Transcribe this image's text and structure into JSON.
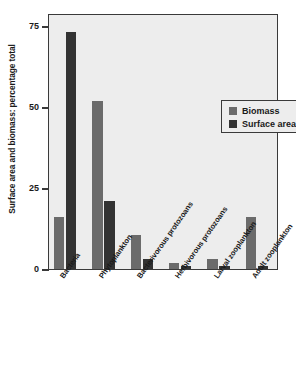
{
  "chart_data": {
    "type": "bar",
    "title": "",
    "xlabel": "",
    "ylabel": "Surface area and biomass: percentage total",
    "ylim": [
      0,
      79
    ],
    "yticks": [
      0,
      25,
      50,
      75
    ],
    "ytick_labels": [
      "0",
      "25",
      "50",
      "75"
    ],
    "grid": false,
    "legend_position": "upper right",
    "categories": [
      "Bacteria",
      "Phytoplankton",
      "Bacterivorous protozoans",
      "Herbivorous protozoans",
      "Larval zooplankton",
      "Adult zooplankton"
    ],
    "series": [
      {
        "name": "Biomass",
        "color": "#6b6b6b",
        "values": [
          16,
          52,
          10.5,
          2,
          3,
          16
        ]
      },
      {
        "name": "Surface area",
        "color": "#333333",
        "values": [
          73,
          21,
          3,
          0.8,
          0.8,
          0.8
        ]
      }
    ]
  },
  "legend": {
    "items": [
      {
        "label": "Biomass"
      },
      {
        "label": "Surface area"
      }
    ]
  },
  "colors": {
    "biomass": "#6b6b6b",
    "surface_area": "#333333",
    "plot_background": "#ededed",
    "frame": "#3a3a3a",
    "page_background": "#ffffff"
  }
}
